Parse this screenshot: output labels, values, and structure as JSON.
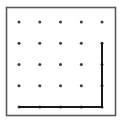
{
  "figure": {
    "title": "Geoboard with right triangle",
    "caption": "",
    "canvas": {
      "width": 122,
      "height": 123,
      "background": "#ffffff"
    }
  },
  "board": {
    "name": "geoboard-frame",
    "x": 6.5,
    "y": 7.5,
    "width": 109,
    "height": 108,
    "stroke_color": "#5a5a5a",
    "stroke_width": 1.6,
    "fill_color": "#ffffff"
  },
  "chart_data": {
    "type": "scatter",
    "title": "Geoboard with right triangle",
    "xlabel": "",
    "ylabel": "",
    "grid": false,
    "legend": "none",
    "xlim": [
      0,
      4
    ],
    "ylim": [
      0,
      4
    ],
    "peg_columns": 5,
    "peg_rows": 5,
    "peg_spacing_px": 20.75,
    "peg_color": "#3c3c3c",
    "peg_radius_px": 1.5,
    "pegs": [
      {
        "col": 0,
        "row": 0,
        "x": 19,
        "y": 22
      },
      {
        "col": 1,
        "row": 0,
        "x": 39.8,
        "y": 22
      },
      {
        "col": 2,
        "row": 0,
        "x": 60.5,
        "y": 22
      },
      {
        "col": 3,
        "row": 0,
        "x": 81.3,
        "y": 22
      },
      {
        "col": 4,
        "row": 0,
        "x": 102,
        "y": 22
      },
      {
        "col": 0,
        "row": 1,
        "x": 19,
        "y": 43.3
      },
      {
        "col": 1,
        "row": 1,
        "x": 39.8,
        "y": 43.3
      },
      {
        "col": 2,
        "row": 1,
        "x": 60.5,
        "y": 43.3
      },
      {
        "col": 3,
        "row": 1,
        "x": 81.3,
        "y": 43.3
      },
      {
        "col": 4,
        "row": 1,
        "x": 102,
        "y": 43.3
      },
      {
        "col": 0,
        "row": 2,
        "x": 19,
        "y": 64.5
      },
      {
        "col": 1,
        "row": 2,
        "x": 39.8,
        "y": 64.5
      },
      {
        "col": 2,
        "row": 2,
        "x": 60.5,
        "y": 64.5
      },
      {
        "col": 3,
        "row": 2,
        "x": 81.3,
        "y": 64.5
      },
      {
        "col": 4,
        "row": 2,
        "x": 102,
        "y": 64.5
      },
      {
        "col": 0,
        "row": 3,
        "x": 19,
        "y": 85.8
      },
      {
        "col": 1,
        "row": 3,
        "x": 39.8,
        "y": 85.8
      },
      {
        "col": 2,
        "row": 3,
        "x": 60.5,
        "y": 85.8
      },
      {
        "col": 3,
        "row": 3,
        "x": 81.3,
        "y": 85.8
      },
      {
        "col": 4,
        "row": 3,
        "x": 102,
        "y": 85.8
      },
      {
        "col": 0,
        "row": 4,
        "x": 19,
        "y": 107
      },
      {
        "col": 1,
        "row": 4,
        "x": 39.8,
        "y": 107
      },
      {
        "col": 2,
        "row": 4,
        "x": 60.5,
        "y": 107
      },
      {
        "col": 3,
        "row": 4,
        "x": 81.3,
        "y": 107
      },
      {
        "col": 4,
        "row": 4,
        "x": 102,
        "y": 107
      }
    ]
  },
  "shape": {
    "name": "right-triangle",
    "kind": "right triangle",
    "stroke_color": "#1a1a1a",
    "stroke_width": 2,
    "fill": "none",
    "points_px": "19,107 102,107 102,42.5",
    "vertices": [
      {
        "label": "bottom-left",
        "grid_col": 0,
        "grid_row": 4,
        "x": 19,
        "y": 107
      },
      {
        "label": "bottom-right",
        "grid_col": 4,
        "grid_row": 4,
        "x": 102,
        "y": 107
      },
      {
        "label": "top-right",
        "grid_col": 4,
        "grid_row": 1,
        "x": 102,
        "y": 42.5
      }
    ],
    "legs": {
      "base_units": 4,
      "height_units": 3
    }
  }
}
